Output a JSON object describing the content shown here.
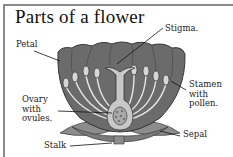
{
  "title": "Parts of a flower",
  "labels": {
    "stigma": "Stigma.",
    "petal": "Petal",
    "stamen": [
      "Stamen",
      "with",
      "pollen."
    ],
    "ovary": [
      "Ovary",
      "with",
      "ovules."
    ],
    "sepal": "Sepal",
    "stalk": "Stalk"
  },
  "colors": {
    "petal": "#6b6b6b",
    "petal_dark": "#4a4a4a",
    "sepal": "#8c8c8c",
    "pistil": "#c8c8c8",
    "filament": "#e6e6e6",
    "frame": "#8a8a8a"
  }
}
